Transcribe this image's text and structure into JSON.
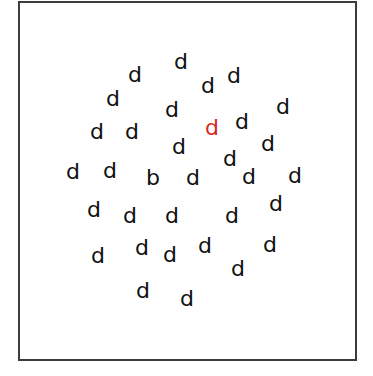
{
  "stimulus": {
    "frame": {
      "left": 18,
      "top": 1,
      "width": 335,
      "height": 356,
      "border_color": "#3c3c3c"
    },
    "default_color": "#111111",
    "highlight_color": "#d62a1e",
    "letters": [
      {
        "char": "d",
        "x": 181,
        "y": 62
      },
      {
        "char": "d",
        "x": 135,
        "y": 75
      },
      {
        "char": "d",
        "x": 234,
        "y": 76
      },
      {
        "char": "d",
        "x": 208,
        "y": 86
      },
      {
        "char": "d",
        "x": 113,
        "y": 99
      },
      {
        "char": "d",
        "x": 283,
        "y": 107
      },
      {
        "char": "d",
        "x": 172,
        "y": 110
      },
      {
        "char": "d",
        "x": 242,
        "y": 122
      },
      {
        "char": "d",
        "x": 212,
        "y": 128,
        "color": "red"
      },
      {
        "char": "d",
        "x": 97,
        "y": 132
      },
      {
        "char": "d",
        "x": 132,
        "y": 132
      },
      {
        "char": "d",
        "x": 268,
        "y": 144
      },
      {
        "char": "d",
        "x": 179,
        "y": 147
      },
      {
        "char": "d",
        "x": 230,
        "y": 159
      },
      {
        "char": "d",
        "x": 110,
        "y": 171
      },
      {
        "char": "d",
        "x": 73,
        "y": 172
      },
      {
        "char": "d",
        "x": 295,
        "y": 176
      },
      {
        "char": "d",
        "x": 249,
        "y": 177
      },
      {
        "char": "b",
        "x": 153,
        "y": 178
      },
      {
        "char": "d",
        "x": 193,
        "y": 178
      },
      {
        "char": "d",
        "x": 276,
        "y": 204
      },
      {
        "char": "d",
        "x": 94,
        "y": 210
      },
      {
        "char": "d",
        "x": 130,
        "y": 216
      },
      {
        "char": "d",
        "x": 172,
        "y": 216
      },
      {
        "char": "d",
        "x": 232,
        "y": 216
      },
      {
        "char": "d",
        "x": 270,
        "y": 245
      },
      {
        "char": "d",
        "x": 205,
        "y": 246
      },
      {
        "char": "d",
        "x": 142,
        "y": 248
      },
      {
        "char": "d",
        "x": 170,
        "y": 255
      },
      {
        "char": "d",
        "x": 98,
        "y": 256
      },
      {
        "char": "d",
        "x": 238,
        "y": 269
      },
      {
        "char": "d",
        "x": 143,
        "y": 291
      },
      {
        "char": "d",
        "x": 187,
        "y": 299
      }
    ]
  }
}
